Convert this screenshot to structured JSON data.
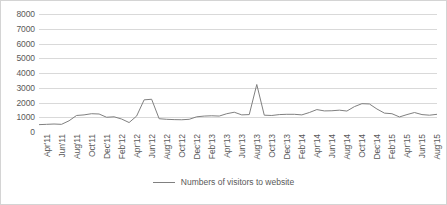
{
  "chart_data": {
    "type": "line",
    "title": "",
    "xlabel": "",
    "ylabel": "",
    "ylim": [
      0,
      8000
    ],
    "ytick_values": [
      0,
      1000,
      2000,
      3000,
      4000,
      5000,
      6000,
      7000,
      8000
    ],
    "ytick_labels": [
      "0",
      "1000",
      "2000",
      "3000",
      "4000",
      "5000",
      "6000",
      "7000",
      "8000"
    ],
    "grid": true,
    "legend_position": "bottom",
    "legend": [
      "Numbers of visitors to website"
    ],
    "line_color": "#808080",
    "grid_color": "#d9d9d9",
    "x_tick_labels": [
      "Apr'11",
      "Jun'11",
      "Aug'11",
      "Oct'11",
      "Dec'11",
      "Feb'12",
      "Apr'12",
      "Jun'12",
      "Aug'12",
      "Oct'12",
      "Dec'12",
      "Feb'13",
      "Apr'13",
      "Jun'13",
      "Aug'13",
      "Oct'13",
      "Dec'13",
      "Feb'14",
      "Apr'14",
      "Jun'14",
      "Aug'14",
      "Oct'14",
      "Dec'14",
      "Feb'15",
      "Apr'15",
      "Jun'15",
      "Aug'15"
    ],
    "x": [
      "Apr'11",
      "May'11",
      "Jun'11",
      "Jul'11",
      "Aug'11",
      "Sep'11",
      "Oct'11",
      "Nov'11",
      "Dec'11",
      "Jan'12",
      "Feb'12",
      "Mar'12",
      "Apr'12",
      "May'12",
      "Jun'12",
      "Jul'12",
      "Aug'12",
      "Sep'12",
      "Oct'12",
      "Nov'12",
      "Dec'12",
      "Jan'13",
      "Feb'13",
      "Mar'13",
      "Apr'13",
      "May'13",
      "Jun'13",
      "Jul'13",
      "Aug'13",
      "Sep'13",
      "Oct'13",
      "Nov'13",
      "Dec'13",
      "Jan'14",
      "Feb'14",
      "Mar'14",
      "Apr'14",
      "May'14",
      "Jun'14",
      "Jul'14",
      "Aug'14",
      "Sep'14",
      "Oct'14",
      "Nov'14",
      "Dec'14",
      "Jan'15",
      "Feb'15",
      "Mar'15",
      "Apr'15",
      "May'15",
      "Jun'15",
      "Jul'15",
      "Aug'15",
      "Sep'15"
    ],
    "series": [
      {
        "name": "Numbers of visitors to website",
        "values": [
          500,
          520,
          540,
          520,
          760,
          1120,
          1160,
          1240,
          1220,
          1000,
          1030,
          880,
          640,
          1080,
          2180,
          2220,
          900,
          860,
          840,
          830,
          860,
          1030,
          1080,
          1100,
          1080,
          1240,
          1340,
          1160,
          1180,
          3220,
          1140,
          1120,
          1180,
          1200,
          1200,
          1160,
          1320,
          1520,
          1430,
          1440,
          1480,
          1420,
          1720,
          1920,
          1900,
          1560,
          1280,
          1240,
          1020,
          1180,
          1320,
          1180,
          1140,
          1200
        ]
      }
    ],
    "series_detail_note": "monthly values Apr'11-Sep'15"
  },
  "legend": {
    "label": "Numbers of visitors to website"
  }
}
